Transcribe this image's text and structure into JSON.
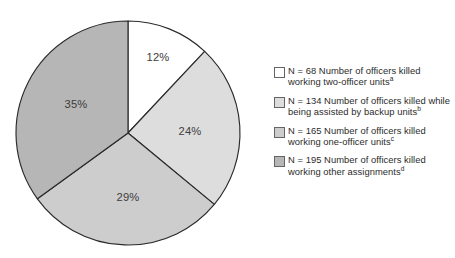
{
  "chart_data": {
    "type": "pie",
    "title": "",
    "subtitle": "",
    "xlabel": "",
    "ylabel": "",
    "legend_position": "right",
    "grid": false,
    "start_angle_deg": 0,
    "direction": "clockwise",
    "categories": [
      "Number of officers killed working two-officer units",
      "Number of officers killed while being assisted by backup units",
      "Number of officers killed working one-officer units",
      "Number of officers killed working other assignments"
    ],
    "values": [
      12,
      24,
      29,
      35
    ],
    "counts": [
      68,
      134,
      165,
      195
    ],
    "value_unit": "percent",
    "data_labels": [
      "12%",
      "24%",
      "29%",
      "35%"
    ],
    "colors": [
      "#ffffff",
      "#dddddd",
      "#cdcdcd",
      "#b6b6b6"
    ],
    "slices": [
      {
        "label": "12%",
        "percent": 12,
        "count": 68,
        "color": "#ffffff",
        "footnote": "a",
        "label_x": 158,
        "label_y": 58
      },
      {
        "label": "24%",
        "percent": 24,
        "count": 134,
        "color": "#dddddd",
        "footnote": "b",
        "label_x": 190,
        "label_y": 132
      },
      {
        "label": "29%",
        "percent": 29,
        "count": 165,
        "color": "#cdcdcd",
        "footnote": "c",
        "label_x": 128,
        "label_y": 198
      },
      {
        "label": "35%",
        "percent": 35,
        "count": 195,
        "color": "#b6b6b6",
        "footnote": "d",
        "label_x": 76,
        "label_y": 105
      }
    ]
  },
  "pie": {
    "center_x": 128,
    "center_y": 133,
    "radius": 112,
    "stroke_color": "#2a2a2a",
    "labels": {
      "slice_0": "12%",
      "slice_1": "24%",
      "slice_2": "29%",
      "slice_3": "35%"
    }
  },
  "legend": {
    "items": [
      {
        "swatch_color": "#ffffff",
        "n_label": "N = 68",
        "description": "Number of officers killed working two-officer units",
        "footnote": "a",
        "full_text": "N = 68 Number of officers killed working two-officer units"
      },
      {
        "swatch_color": "#dddddd",
        "n_label": "N = 134",
        "description": "Number of officers killed while being assisted by backup units",
        "footnote": "b",
        "full_text": "N = 134 Number of officers killed while being assisted by backup units"
      },
      {
        "swatch_color": "#cdcdcd",
        "n_label": "N = 165",
        "description": "Number of officers killed working one-officer units",
        "footnote": "c",
        "full_text": "N = 165 Number of officers killed working one-officer units"
      },
      {
        "swatch_color": "#b6b6b6",
        "n_label": "N = 195",
        "description": "Number of officers killed working other assignments",
        "footnote": "d",
        "full_text": "N = 195 Number of officers killed working other assignments"
      }
    ]
  }
}
